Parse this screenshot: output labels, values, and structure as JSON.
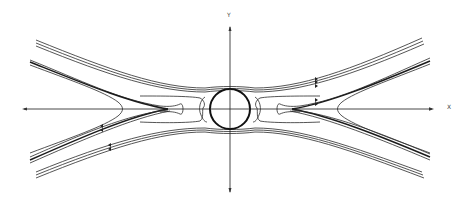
{
  "figure": {
    "type": "streamline-diagram",
    "axes": {
      "x_label": "X",
      "y_label": "Y"
    },
    "colors": {
      "line": "#2a2a2a",
      "background": "#ffffff"
    },
    "elements": {
      "circle": "central circular body",
      "streamline_groups": [
        "upper outer band",
        "upper inner band",
        "lower inner band",
        "lower outer band"
      ],
      "separatrix": "cusp streamlines meeting at x axis on both sides",
      "flow_arrows": "small arrow ticks on streamlines indicating direction"
    }
  }
}
